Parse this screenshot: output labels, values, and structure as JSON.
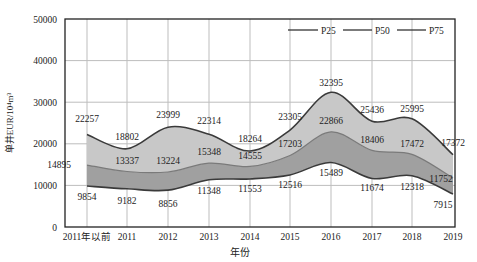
{
  "chart_data": {
    "type": "area",
    "title": "",
    "xlabel": "年份",
    "ylabel": "单井EUR/10⁴m³",
    "ylim": [
      0,
      50000
    ],
    "yticks": [
      0,
      10000,
      20000,
      30000,
      40000,
      50000
    ],
    "grid": true,
    "legend_position": "top-right",
    "categories": [
      "2011年以前",
      "2011",
      "2012",
      "2013",
      "2014",
      "2015",
      "2016",
      "2017",
      "2018",
      "2019"
    ],
    "series": [
      {
        "name": "P25",
        "values": [
          9854,
          9182,
          8856,
          11348,
          11553,
          12516,
          15489,
          11674,
          12318,
          7915
        ]
      },
      {
        "name": "P50",
        "values": [
          14895,
          13337,
          13224,
          15348,
          14555,
          17203,
          22866,
          18406,
          17472,
          11752
        ]
      },
      {
        "name": "P75",
        "values": [
          22257,
          18802,
          23999,
          22314,
          18264,
          23305,
          32395,
          25436,
          25995,
          17372
        ]
      }
    ],
    "colors": {
      "upper_band": "#c8c8c8",
      "lower_band": "#a0a0a0",
      "line": "#444444",
      "grid": "#bdbdbd",
      "axis": "#222222"
    }
  }
}
